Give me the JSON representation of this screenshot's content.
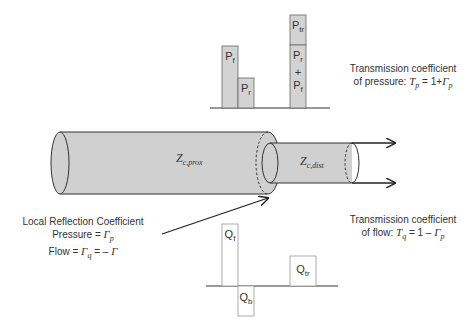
{
  "pressure_chart": {
    "bars": [
      {
        "id": "Pf",
        "label": "P",
        "sub": "f"
      },
      {
        "id": "Pr",
        "label": "P",
        "sub": "r"
      },
      {
        "id": "Ptr",
        "label": "P",
        "sub": "tr"
      }
    ],
    "stack_lower": {
      "line1": "P",
      "line1_sub": "r",
      "plus": "+",
      "line2": "P",
      "line2_sub": "f"
    }
  },
  "flow_chart": {
    "bars": [
      {
        "id": "Qf",
        "label": "Q",
        "sub": "f"
      },
      {
        "id": "Qb",
        "label": "Q",
        "sub": "b"
      },
      {
        "id": "Qtr",
        "label": "Q",
        "sub": "tr"
      }
    ]
  },
  "vessels": {
    "proximal": {
      "label": "Z",
      "sub": "c,prox"
    },
    "distal": {
      "label": "Z",
      "sub": "c,dist"
    }
  },
  "annotations": {
    "pressure_transmission": {
      "line1": "Transmission coefficient",
      "line2_prefix": "of pressure: ",
      "formula_T": "T",
      "formula_T_sub": "p",
      "formula_eq": " = 1+",
      "formula_G": "Γ",
      "formula_G_sub": "p"
    },
    "flow_transmission": {
      "line1": "Transmission coefficient",
      "line2_prefix": "of flow: ",
      "formula_T": "T",
      "formula_T_sub": "q",
      "formula_eq": " = 1 – ",
      "formula_G": "Γ",
      "formula_G_sub": "p"
    },
    "local_reflection": {
      "title": "Local Reflection Coefficient",
      "pressure_prefix": "Pressure = ",
      "pressure_G": "Γ",
      "pressure_G_sub": "p",
      "flow_prefix": "Flow = ",
      "flow_G": "Γ",
      "flow_G_sub": "q",
      "flow_eq": " = – ",
      "flow_G2": "Γ"
    }
  },
  "colors": {
    "fill": "#d0d0d0",
    "stroke": "#333333",
    "bar_fill": "#d3d3d3",
    "bar_stroke": "#666666",
    "flow_bar_fill": "#ffffff",
    "flow_bar_stroke": "#999999"
  }
}
